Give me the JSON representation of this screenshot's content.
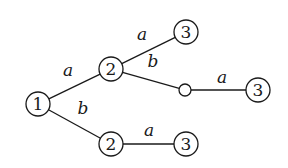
{
  "diagram": {
    "type": "tree",
    "nodes": [
      {
        "id": "n1",
        "label": "1",
        "x": 38,
        "y": 104,
        "r": 12
      },
      {
        "id": "n2a",
        "label": "2",
        "x": 111,
        "y": 69,
        "r": 12
      },
      {
        "id": "n2b",
        "label": "2",
        "x": 111,
        "y": 144,
        "r": 12
      },
      {
        "id": "n3a",
        "label": "3",
        "x": 186,
        "y": 32,
        "r": 12
      },
      {
        "id": "nEmpty",
        "label": "",
        "x": 185,
        "y": 90,
        "r": 6
      },
      {
        "id": "n3b",
        "label": "3",
        "x": 258,
        "y": 90,
        "r": 12
      },
      {
        "id": "n3c",
        "label": "3",
        "x": 186,
        "y": 144,
        "r": 12
      }
    ],
    "edges": [
      {
        "from": "n1",
        "to": "n2a",
        "label": "a",
        "lx": 68,
        "ly": 76
      },
      {
        "from": "n1",
        "to": "n2b",
        "label": "b",
        "lx": 83,
        "ly": 114
      },
      {
        "from": "n2a",
        "to": "n3a",
        "label": "a",
        "lx": 142,
        "ly": 40
      },
      {
        "from": "n2a",
        "to": "nEmpty",
        "label": "b",
        "lx": 153,
        "ly": 67
      },
      {
        "from": "nEmpty",
        "to": "n3b",
        "label": "a",
        "lx": 222,
        "ly": 83
      },
      {
        "from": "n2b",
        "to": "n3c",
        "label": "a",
        "lx": 149,
        "ly": 136
      }
    ]
  }
}
